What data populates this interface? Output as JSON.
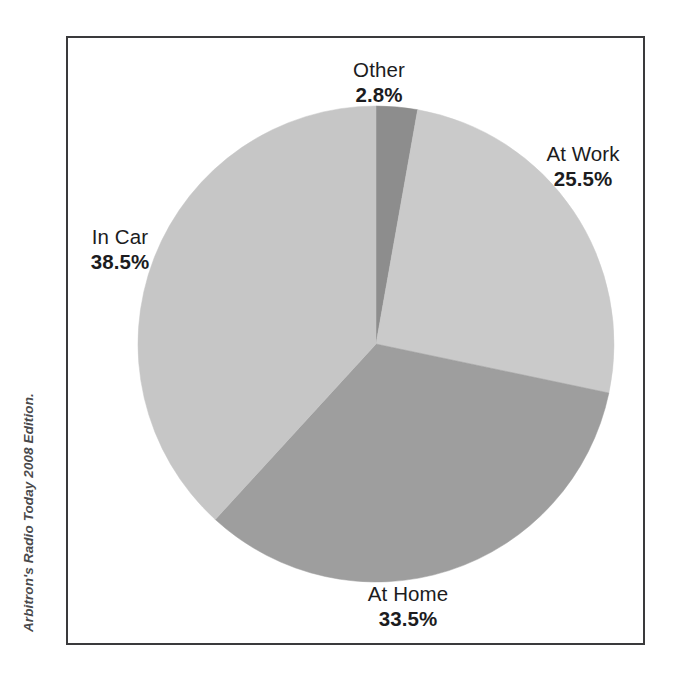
{
  "figure": {
    "source_credit": "Arbitron's Radio Today 2008 Edition.",
    "frame_color": "#3a3a3c",
    "background_color": "#ffffff"
  },
  "chart_data": {
    "type": "pie",
    "title": "",
    "subtitle": "",
    "xlabel": "",
    "ylabel": "",
    "grid": false,
    "legend_position": "none",
    "labels_position": "outside",
    "start_angle_deg": 0,
    "direction": "clockwise",
    "units": "percent",
    "categories": [
      "Other",
      "At Work",
      "At Home",
      "In Car"
    ],
    "values": [
      2.8,
      25.5,
      33.5,
      38.5
    ],
    "slices": [
      {
        "name": "Other",
        "value": 2.8,
        "value_label": "2.8%",
        "color": "#8d8d8d",
        "start_angle_deg": 0.0,
        "end_angle_deg": 10.08
      },
      {
        "name": "At Work",
        "value": 25.5,
        "value_label": "25.5%",
        "color": "#cacaca",
        "start_angle_deg": 10.08,
        "end_angle_deg": 101.88
      },
      {
        "name": "At Home",
        "value": 33.5,
        "value_label": "33.5%",
        "color": "#9e9e9e",
        "start_angle_deg": 101.88,
        "end_angle_deg": 222.48
      },
      {
        "name": "In Car",
        "value": 38.5,
        "value_label": "38.5%",
        "color": "#c6c6c6",
        "start_angle_deg": 222.48,
        "end_angle_deg": 360.0
      }
    ],
    "annotations": [
      "Arbitron's Radio Today 2008 Edition."
    ]
  },
  "labels": {
    "other": {
      "name": "Other",
      "value": "2.8%"
    },
    "at_work": {
      "name": "At Work",
      "value": "25.5%"
    },
    "in_car": {
      "name": "In Car",
      "value": "38.5%"
    },
    "at_home": {
      "name": "At Home",
      "value": "33.5%"
    }
  }
}
